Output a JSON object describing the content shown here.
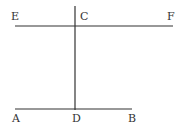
{
  "diagram": {
    "labels": {
      "E": "E",
      "C": "C",
      "F": "F",
      "A": "A",
      "D": "D",
      "B": "B"
    },
    "lines": [
      {
        "name": "EF",
        "from": "E",
        "to": "F"
      },
      {
        "name": "AB",
        "from": "A",
        "to": "B"
      },
      {
        "name": "CD",
        "from": "C",
        "to": "D"
      }
    ],
    "colors": {
      "stroke": "#333333",
      "background": "#ffffff"
    }
  }
}
